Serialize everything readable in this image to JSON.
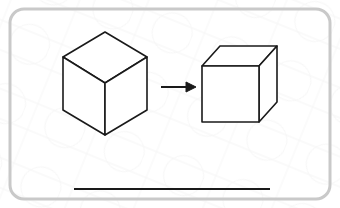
{
  "page": {
    "title": "Cube Transformation Diagram",
    "width": 340,
    "height": 208,
    "background_color": "#ffffff"
  },
  "frame": {
    "name": "rounded-border-frame",
    "stroke_color": "#c9c9c9",
    "stroke_width": 3,
    "corner_radius": 14,
    "x": 10,
    "y": 9,
    "width": 320,
    "height": 190
  },
  "watermark": {
    "visible": true,
    "color": "#f2f2f2",
    "description": "faint light gray diagonal line texture in background"
  },
  "diagram": {
    "type": "geometry-transformation",
    "ink_color": "#1a1a1a",
    "fill_color": "#ffffff",
    "left_shape": {
      "name": "isometric-cube",
      "label": "",
      "stroke_width": 1.6,
      "vertices": {
        "top_apex": [
          105,
          32
        ],
        "top_left": [
          63,
          57
        ],
        "top_right": [
          147,
          57
        ],
        "center": [
          105,
          83
        ],
        "bottom_left": [
          63,
          110
        ],
        "bottom_right": [
          147,
          110
        ],
        "bottom_apex": [
          105,
          135
        ]
      },
      "faces": [
        {
          "name": "top-face",
          "points": "105,32 147,57 105,83 63,57"
        },
        {
          "name": "left-face",
          "points": "63,57 105,83 105,135 63,110"
        },
        {
          "name": "right-face",
          "points": "147,57 147,110 105,135 105,83"
        }
      ]
    },
    "arrow": {
      "name": "transformation-arrow",
      "direction": "right",
      "stroke_width": 2,
      "x1": 161,
      "y1": 87,
      "x2": 188,
      "y2": 87,
      "head_points": "186,82 196,87 186,92"
    },
    "right_shape": {
      "name": "cabinet-projection-cube",
      "label": "",
      "stroke_width": 1.6,
      "front_face": {
        "x": 202,
        "y": 66,
        "width": 57,
        "height": 56
      },
      "depth_offset": [
        18,
        -20
      ],
      "vertices": {
        "front_top_left": [
          202,
          66
        ],
        "front_top_right": [
          259,
          66
        ],
        "front_bottom_right": [
          259,
          122
        ],
        "front_bottom_left": [
          202,
          122
        ],
        "back_top_left": [
          220,
          46
        ],
        "back_top_right": [
          277,
          46
        ],
        "back_bottom_right": [
          277,
          102
        ]
      },
      "faces": [
        {
          "name": "front-face",
          "points": "202,66 259,66 259,122 202,122"
        },
        {
          "name": "top-face",
          "points": "202,66 220,46 277,46 259,66"
        },
        {
          "name": "right-face",
          "points": "259,66 277,46 277,102 259,122"
        }
      ]
    },
    "rule": {
      "name": "answer-rule-line",
      "stroke_color": "#1a1a1a",
      "stroke_width": 2,
      "x1": 74,
      "y1": 189,
      "x2": 270,
      "y2": 189
    }
  }
}
